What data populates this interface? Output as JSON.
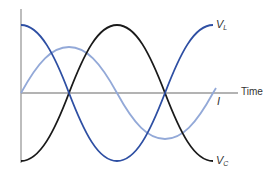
{
  "diagram": {
    "title": "",
    "axes": {
      "horizontal_label": "Time",
      "vertical_label": ""
    },
    "curves": [
      {
        "id": "V_L",
        "label_main": "V",
        "label_sub": "L",
        "description": "Inductor voltage (leads current by 90°)",
        "color": "#2e4fa3"
      },
      {
        "id": "I",
        "label_main": "I",
        "label_sub": "",
        "description": "Current",
        "color": "#93a9d8"
      },
      {
        "id": "V_C",
        "label_main": "V",
        "label_sub": "C",
        "description": "Capacitor voltage (lags current by 90°)",
        "color": "#1a1a1a"
      }
    ],
    "colors": {
      "axis": "#9a9a9a",
      "v_l": "#2e4fa3",
      "current": "#93a9d8",
      "v_c": "#1a1a1a",
      "text": "#333333"
    }
  }
}
